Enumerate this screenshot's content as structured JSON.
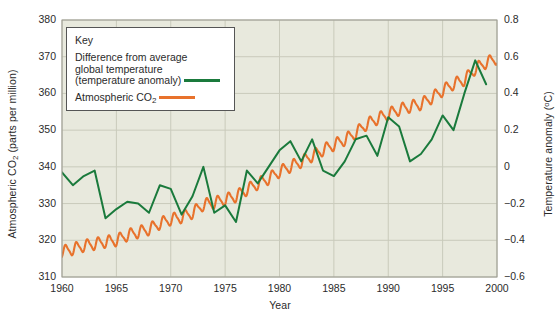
{
  "chart_data": {
    "type": "line",
    "title": "",
    "xlabel": "Year",
    "ylabel": "Atmospheric CO2 (parts per million)",
    "ylabel_right": "Temperature anomaly (°C)",
    "xlim": [
      1960,
      2000
    ],
    "ylim": [
      310,
      380
    ],
    "ylim_right": [
      -0.6,
      0.8
    ],
    "grid": true,
    "legend_position": "top-left",
    "legend_title": "Key",
    "xticks": [
      1960,
      1965,
      1970,
      1975,
      1980,
      1985,
      1990,
      1995,
      2000
    ],
    "yticks_left": [
      310,
      320,
      330,
      340,
      350,
      360,
      370,
      380
    ],
    "yticks_right": [
      -0.6,
      -0.4,
      -0.2,
      0,
      0.2,
      0.4,
      0.6,
      0.8
    ],
    "yticks_right_labels": [
      "−0.6",
      "−0.4",
      "−0.2",
      "0",
      "0.2",
      "0.4",
      "0.6",
      "0.8"
    ],
    "series": [
      {
        "name": "Difference from average global temperature (temperature anomaly)",
        "color": "#1a7a3c",
        "axis": "right",
        "unit": "°C",
        "x": [
          1960,
          1961,
          1962,
          1963,
          1964,
          1965,
          1966,
          1967,
          1968,
          1969,
          1970,
          1971,
          1972,
          1973,
          1974,
          1975,
          1976,
          1977,
          1978,
          1979,
          1980,
          1981,
          1982,
          1983,
          1984,
          1985,
          1986,
          1987,
          1988,
          1989,
          1990,
          1991,
          1992,
          1993,
          1994,
          1995,
          1996,
          1997,
          1998,
          1999
        ],
        "values": [
          -0.03,
          -0.1,
          -0.05,
          -0.02,
          -0.28,
          -0.23,
          -0.19,
          -0.2,
          -0.25,
          -0.1,
          -0.12,
          -0.26,
          -0.16,
          0.0,
          -0.25,
          -0.21,
          -0.3,
          -0.02,
          -0.09,
          0.0,
          0.09,
          0.14,
          0.03,
          0.15,
          -0.02,
          -0.05,
          0.03,
          0.15,
          0.17,
          0.06,
          0.27,
          0.22,
          0.03,
          0.07,
          0.15,
          0.28,
          0.2,
          0.4,
          0.58,
          0.45
        ]
      },
      {
        "name": "Atmospheric CO2",
        "color": "#e8722c",
        "axis": "left",
        "unit": "ppm",
        "x": [
          1960,
          1961,
          1962,
          1963,
          1964,
          1965,
          1966,
          1967,
          1968,
          1969,
          1970,
          1971,
          1972,
          1973,
          1974,
          1975,
          1976,
          1977,
          1978,
          1979,
          1980,
          1981,
          1982,
          1983,
          1984,
          1985,
          1986,
          1987,
          1988,
          1989,
          1990,
          1991,
          1992,
          1993,
          1994,
          1995,
          1996,
          1997,
          1998,
          1999,
          2000
        ],
        "values": [
          316.9,
          317.6,
          318.5,
          319.0,
          319.6,
          320.0,
          321.4,
          322.2,
          323.0,
          324.6,
          325.7,
          326.3,
          327.5,
          329.7,
          330.2,
          331.1,
          332.0,
          333.8,
          335.4,
          336.8,
          338.7,
          340.1,
          341.4,
          343.0,
          344.6,
          346.0,
          347.4,
          349.2,
          351.6,
          353.1,
          354.4,
          355.6,
          356.4,
          357.1,
          358.8,
          360.8,
          362.6,
          363.7,
          366.7,
          368.4,
          369.5
        ],
        "seasonal_amplitude_ppm": 3.0,
        "pattern": "sawtooth seasonal oscillation superimposed on rising trend"
      }
    ]
  },
  "legend": {
    "title": "Key",
    "entries": [
      {
        "label_line1": "Difference from average",
        "label_line2": "global temperature",
        "label_line3_pre": "(temperature anomaly)",
        "color": "#1a7a3c"
      },
      {
        "label_pre": "Atmospheric CO",
        "label_sub": "2",
        "color": "#e8722c"
      }
    ]
  },
  "axes": {
    "left_title_pre": "Atmospheric CO",
    "left_title_sub": "2",
    "left_title_post": " (parts per million)",
    "right_title_pre": "Temperature anomaly (",
    "right_title_sup": "o",
    "right_title_post": "C)",
    "x_title": "Year"
  },
  "colors": {
    "plot_background": "#e8e9dd",
    "grid": "#c9cabb",
    "border": "#9a9a90",
    "green": "#1a7a3c",
    "orange": "#e8722c",
    "text": "#2b2b2b"
  }
}
